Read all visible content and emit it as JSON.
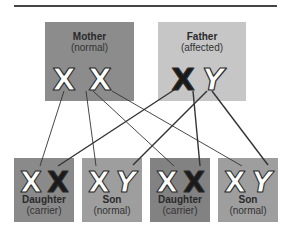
{
  "title_rule": true,
  "parents": [
    {
      "id": "mother",
      "label": "Mother",
      "status": "(normal)",
      "chromosomes": [
        "X",
        "X"
      ],
      "affected": [
        false,
        false
      ],
      "color": "#8c8c8c"
    },
    {
      "id": "father",
      "label": "Father",
      "status": "(affected)",
      "chromosomes": [
        "X",
        "Y"
      ],
      "affected": [
        true,
        false
      ],
      "color": "#c6c6c6"
    }
  ],
  "children": [
    {
      "id": "daughter1",
      "label": "Daughter",
      "status": "(carrier)",
      "chromosomes": [
        "X",
        "X"
      ],
      "affected": [
        false,
        true
      ],
      "color": "#8a8a8a"
    },
    {
      "id": "son1",
      "label": "Son",
      "status": "(normal)",
      "chromosomes": [
        "X",
        "Y"
      ],
      "affected": [
        false,
        false
      ],
      "color": "#9e9e9e"
    },
    {
      "id": "daughter2",
      "label": "Daughter",
      "status": "(carrier)",
      "chromosomes": [
        "X",
        "X"
      ],
      "affected": [
        false,
        true
      ],
      "color": "#828282"
    },
    {
      "id": "son2",
      "label": "Son",
      "status": "(normal)",
      "chromosomes": [
        "X",
        "Y"
      ],
      "affected": [
        false,
        false
      ],
      "color": "#9e9e9e"
    }
  ],
  "colors": {
    "affected_fill": "#1a1a1a",
    "normal_fill": "#ffffff",
    "outline": "#2a2a2a",
    "line": "#333333"
  }
}
